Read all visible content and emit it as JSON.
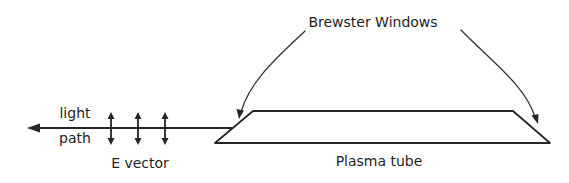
{
  "diagram": {
    "title_label": "Brewster Windows",
    "light_label_line1": "light",
    "light_label_line2": "path",
    "e_vector_label": "E vector",
    "tube_label": "Plasma tube",
    "e_vector_arrow_count": 3,
    "colors": {
      "background": "#ffffff",
      "ink": "#262626"
    }
  }
}
